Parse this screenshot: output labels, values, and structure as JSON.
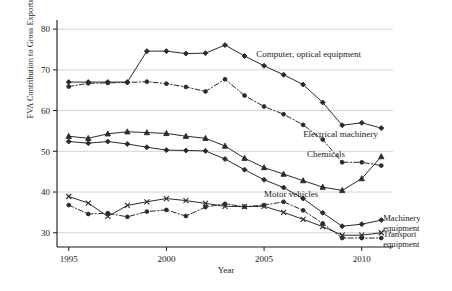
{
  "chart_data": {
    "type": "line",
    "title": "",
    "xlabel": "Year",
    "ylabel": "FVA Contribution to Gross Exports (%)",
    "xlim": [
      1994.4,
      2011.6
    ],
    "ylim": [
      26.5,
      82
    ],
    "grid": true,
    "y_ticks": [
      30,
      40,
      50,
      60,
      70,
      80
    ],
    "x_ticks": [
      1995,
      2000,
      2005,
      2010
    ],
    "x": [
      1995,
      1996,
      1997,
      1998,
      1999,
      2000,
      2001,
      2002,
      2003,
      2004,
      2005,
      2006,
      2007,
      2008,
      2009,
      2010,
      2011
    ],
    "legend_position": "inline-annotations",
    "series": [
      {
        "name": "Computer, optical equipment",
        "marker": "diamond",
        "linestyle": "solid",
        "label_x": 2004.6,
        "label_y": 73.2,
        "values": [
          67.0,
          67.0,
          67.0,
          67.0,
          74.6,
          74.6,
          74.0,
          74.1,
          76.1,
          73.4,
          71.0,
          68.8,
          66.4,
          62.0,
          56.4,
          57.0,
          55.7
        ]
      },
      {
        "name": "Electrical machinery",
        "marker": "circle",
        "linestyle": "dashdot",
        "label_x": 2007.0,
        "label_y": 53.4,
        "values": [
          65.9,
          66.7,
          66.8,
          66.9,
          67.1,
          66.6,
          65.8,
          64.7,
          67.7,
          63.7,
          61.0,
          59.1,
          56.5,
          52.9,
          47.3,
          47.3,
          46.5
        ]
      },
      {
        "name": "Chemicals",
        "marker": "triangle",
        "linestyle": "solid",
        "label_x": 2007.2,
        "label_y": 48.6,
        "values": [
          53.7,
          53.2,
          54.3,
          54.8,
          54.6,
          54.4,
          53.7,
          53.2,
          51.3,
          48.3,
          46.0,
          44.4,
          42.8,
          41.2,
          40.4,
          43.3,
          48.7
        ]
      },
      {
        "name": "Motor vehicles",
        "marker": "diamond",
        "linestyle": "solid",
        "label_x": 2005.0,
        "label_y": 38.8,
        "values": [
          52.4,
          52.0,
          52.4,
          51.8,
          51.0,
          50.3,
          50.2,
          50.1,
          48.1,
          45.5,
          43.0,
          41.1,
          38.4,
          34.9,
          31.6,
          32.1,
          33.1
        ]
      },
      {
        "name": "Machinery equipment",
        "marker": "x",
        "linestyle": "solid",
        "label_x": 2011.1,
        "label_y": 33.0,
        "values": [
          38.9,
          37.3,
          34.0,
          36.7,
          37.6,
          38.4,
          37.9,
          37.2,
          36.5,
          36.4,
          36.5,
          35.0,
          33.3,
          31.5,
          29.4,
          29.4,
          30.0
        ]
      },
      {
        "name": "Transport equipment",
        "marker": "circle",
        "linestyle": "dashdot",
        "label_x": 2011.1,
        "label_y": 29.0,
        "values": [
          36.8,
          34.6,
          34.8,
          33.9,
          35.2,
          35.6,
          34.1,
          36.3,
          37.1,
          36.4,
          36.8,
          37.6,
          35.5,
          32.3,
          28.7,
          28.7,
          28.7
        ]
      }
    ],
    "annotations": [
      {
        "text": "Computer, optical equipment"
      },
      {
        "text": "Electrical machinery"
      },
      {
        "text": "Chemicals"
      },
      {
        "text": "Motor vehicles"
      },
      {
        "text": "Machinery"
      },
      {
        "text": "equipment"
      },
      {
        "text": "Transport"
      },
      {
        "text": "equipment"
      }
    ],
    "axis_labels": {
      "x": "Year",
      "y": "FVA Contribution to Gross Exports (%)"
    },
    "tick_labels": {
      "y": [
        "30",
        "40",
        "50",
        "60",
        "70",
        "80"
      ],
      "x": [
        "1995",
        "2000",
        "2005",
        "2010"
      ]
    },
    "colors": {
      "line": "#2b2b2b",
      "grid": "#c9c9c9",
      "axis": "#1a1a1a",
      "text": "#1a1a1a",
      "background": "#ffffff"
    }
  }
}
